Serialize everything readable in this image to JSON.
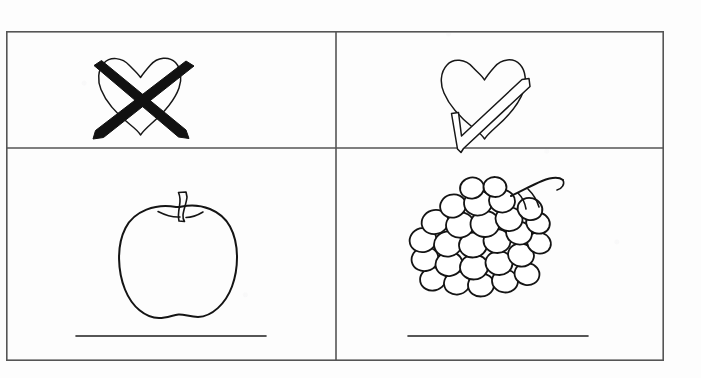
{
  "worksheet": {
    "title": "Fruit preference worksheet",
    "background_color": "#fdfdfd",
    "ink_color": "#1a1a1a",
    "border_color": "#555555"
  },
  "table": {
    "name": "worksheet-table",
    "rows": 2,
    "columns": 2,
    "x": 6,
    "y": 31,
    "width": 658,
    "height": 330,
    "row_heights": [
      117,
      213
    ],
    "column_widths": [
      330,
      328
    ]
  },
  "cells": [
    {
      "id": "cell-dislike-key",
      "row": 1,
      "column": 1,
      "content_type": "icon",
      "icon": "heart-crossed-out-icon",
      "meaning": "do not like",
      "fill_style": "outline heart with thick black X",
      "answer_line": false,
      "caption": ""
    },
    {
      "id": "cell-like-key",
      "row": 1,
      "column": 2,
      "content_type": "icon",
      "icon": "heart-with-check-icon",
      "meaning": "like",
      "fill_style": "outline heart with outlined check mark",
      "answer_line": false,
      "caption": ""
    },
    {
      "id": "cell-apple",
      "row": 2,
      "column": 1,
      "content_type": "drawing",
      "icon": "apple-icon",
      "meaning": "apple",
      "fill_style": "black line drawing, no fill",
      "answer_line": true,
      "caption": ""
    },
    {
      "id": "cell-grapes",
      "row": 2,
      "column": 2,
      "content_type": "drawing",
      "icon": "grapes-icon",
      "meaning": "bunch of grapes",
      "fill_style": "black line drawing, no fill",
      "answer_line": true,
      "caption": ""
    }
  ],
  "answer_lines": [
    {
      "name": "answer-line-apple",
      "x1": 76,
      "x2": 266,
      "y": 336
    },
    {
      "name": "answer-line-grapes",
      "x1": 408,
      "x2": 588,
      "y": 336
    }
  ]
}
